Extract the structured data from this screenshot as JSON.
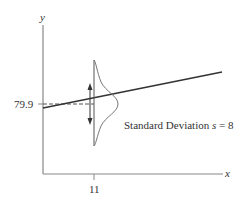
{
  "diagram": {
    "y_axis_label": "y",
    "x_axis_label": "x",
    "y_value_label": "79.9",
    "x_tick_label": "11",
    "annotation_prefix": "Standard Deviation ",
    "annotation_var": "s",
    "annotation_suffix": " = 8",
    "colors": {
      "axis": "#888888",
      "line": "#333333",
      "curve": "#777777",
      "text": "#333333"
    }
  }
}
